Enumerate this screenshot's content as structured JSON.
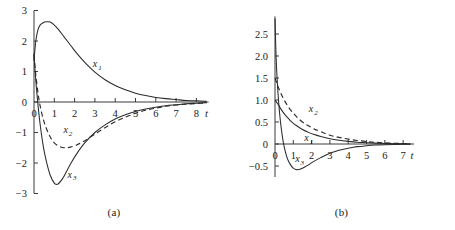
{
  "figure": {
    "kind": "two-panel-line-plot",
    "background": "#ffffff",
    "ink_color": "#2b2b2b"
  },
  "panels": [
    {
      "id": "a",
      "caption": "(a)",
      "xlabel": "t",
      "ylabel": "",
      "xticks": [
        "0",
        "1",
        "2",
        "3",
        "4",
        "5",
        "6",
        "7",
        "8"
      ],
      "yticks": [
        "3",
        "2",
        "1",
        "0",
        "-1",
        "-2",
        "-3"
      ],
      "curve_labels": [
        {
          "base": "x",
          "sub": "1"
        },
        {
          "base": "x",
          "sub": "2"
        },
        {
          "base": "x",
          "sub": "3"
        }
      ]
    },
    {
      "id": "b",
      "caption": "(b)",
      "xlabel": "t",
      "ylabel": "",
      "xticks": [
        "0",
        "1",
        "2",
        "3",
        "4",
        "5",
        "6",
        "7"
      ],
      "yticks": [
        "2.5",
        "2.0",
        "1.5",
        "1.0",
        "0.5",
        "0",
        "-0.5"
      ],
      "curve_labels": [
        {
          "base": "x",
          "sub": "1"
        },
        {
          "base": "x",
          "sub": "2"
        },
        {
          "base": "x",
          "sub": "3"
        }
      ]
    }
  ],
  "chart_data": [
    {
      "type": "line",
      "panel": "(a)",
      "title": "",
      "xlabel": "t",
      "ylabel": "",
      "xlim": [
        0,
        8.6
      ],
      "ylim": [
        -3,
        3
      ],
      "xticks": [
        0,
        1,
        2,
        3,
        4,
        5,
        6,
        7,
        8
      ],
      "yticks": [
        -3,
        -2,
        -1,
        0,
        1,
        2,
        3
      ],
      "grid": false,
      "legend": "inline-labels",
      "series": [
        {
          "name": "x1",
          "style": "solid",
          "label_pos": [
            2.9,
            1.15
          ],
          "x": [
            0,
            0.05,
            0.1,
            0.2,
            0.3,
            0.45,
            0.6,
            0.8,
            1.0,
            1.2,
            1.5,
            1.8,
            2.1,
            2.5,
            3.0,
            3.5,
            4.0,
            4.5,
            5.0,
            5.5,
            6.0,
            6.5,
            7.0,
            7.5,
            8.0,
            8.5
          ],
          "y": [
            1.35,
            1.75,
            2.05,
            2.38,
            2.52,
            2.6,
            2.63,
            2.62,
            2.52,
            2.38,
            2.12,
            1.86,
            1.6,
            1.3,
            0.98,
            0.73,
            0.54,
            0.4,
            0.29,
            0.21,
            0.15,
            0.11,
            0.08,
            0.05,
            0.04,
            0.02
          ]
        },
        {
          "name": "x2",
          "style": "dashed",
          "label_pos": [
            1.45,
            -1.02
          ],
          "x": [
            0,
            0.05,
            0.1,
            0.2,
            0.3,
            0.45,
            0.6,
            0.8,
            1.0,
            1.2,
            1.4,
            1.6,
            1.8,
            2.1,
            2.5,
            3.0,
            3.5,
            4.0,
            4.5,
            5.0,
            5.5,
            6.0,
            6.5,
            7.0,
            7.5,
            8.0,
            8.5
          ],
          "y": [
            1.55,
            1.15,
            0.82,
            0.28,
            -0.12,
            -0.55,
            -0.85,
            -1.15,
            -1.34,
            -1.44,
            -1.49,
            -1.5,
            -1.48,
            -1.41,
            -1.27,
            -1.05,
            -0.84,
            -0.65,
            -0.5,
            -0.37,
            -0.27,
            -0.2,
            -0.14,
            -0.1,
            -0.07,
            -0.05,
            -0.03
          ]
        },
        {
          "name": "x3",
          "style": "solid",
          "label_pos": [
            1.65,
            -2.48
          ],
          "x": [
            0,
            0.05,
            0.1,
            0.2,
            0.3,
            0.45,
            0.6,
            0.8,
            1.0,
            1.1,
            1.2,
            1.4,
            1.6,
            1.8,
            2.1,
            2.5,
            3.0,
            3.5,
            4.0,
            4.5,
            5.0,
            5.5,
            6.0,
            6.5,
            7.0,
            7.5,
            8.0,
            8.5
          ],
          "y": [
            1.6,
            1.05,
            0.62,
            -0.12,
            -0.72,
            -1.42,
            -1.92,
            -2.4,
            -2.66,
            -2.7,
            -2.68,
            -2.52,
            -2.28,
            -2.03,
            -1.7,
            -1.34,
            -1.0,
            -0.75,
            -0.56,
            -0.42,
            -0.31,
            -0.23,
            -0.17,
            -0.12,
            -0.09,
            -0.06,
            -0.04,
            -0.02
          ]
        }
      ]
    },
    {
      "type": "line",
      "panel": "(b)",
      "title": "",
      "xlabel": "t",
      "ylabel": "",
      "xlim": [
        0,
        7.6
      ],
      "ylim": [
        -0.75,
        2.9
      ],
      "xticks": [
        0,
        1,
        2,
        3,
        4,
        5,
        6,
        7
      ],
      "yticks": [
        -0.5,
        0,
        0.5,
        1.0,
        1.5,
        2.0,
        2.5
      ],
      "grid": false,
      "legend": "inline-labels",
      "series": [
        {
          "name": "x1",
          "style": "solid",
          "label_pos": [
            1.6,
            0.06
          ],
          "x": [
            0,
            0.1,
            0.2,
            0.3,
            0.45,
            0.6,
            0.8,
            1.0,
            1.2,
            1.5,
            1.8,
            2.1,
            2.5,
            3.0,
            3.5,
            4.0,
            4.5,
            5.0,
            5.5,
            6.0,
            6.5,
            7.0,
            7.4
          ],
          "y": [
            1.0,
            0.94,
            0.88,
            0.81,
            0.72,
            0.64,
            0.55,
            0.47,
            0.41,
            0.33,
            0.27,
            0.22,
            0.17,
            0.12,
            0.085,
            0.06,
            0.04,
            0.03,
            0.02,
            0.012,
            0.008,
            0.004,
            0.002
          ]
        },
        {
          "name": "x2",
          "style": "dashed",
          "label_pos": [
            1.85,
            0.72
          ],
          "x": [
            0,
            0.1,
            0.2,
            0.3,
            0.45,
            0.6,
            0.8,
            1.0,
            1.2,
            1.5,
            1.8,
            2.1,
            2.5,
            3.0,
            3.5,
            4.0,
            4.5,
            5.0,
            5.5,
            6.0,
            6.5,
            7.0,
            7.4
          ],
          "y": [
            1.5,
            1.38,
            1.27,
            1.17,
            1.04,
            0.93,
            0.8,
            0.7,
            0.61,
            0.5,
            0.42,
            0.35,
            0.28,
            0.2,
            0.15,
            0.11,
            0.08,
            0.055,
            0.038,
            0.025,
            0.016,
            0.01,
            0.005
          ]
        },
        {
          "name": "x3",
          "style": "solid",
          "label_pos": [
            1.1,
            -0.42
          ],
          "x": [
            0,
            0.05,
            0.1,
            0.2,
            0.3,
            0.4,
            0.5,
            0.65,
            0.8,
            1.0,
            1.15,
            1.3,
            1.5,
            1.8,
            2.1,
            2.5,
            3.0,
            3.5,
            4.0,
            4.5,
            5.0,
            5.5,
            6.0,
            6.5,
            7.0,
            7.4
          ],
          "y": [
            2.85,
            2.1,
            1.6,
            0.95,
            0.5,
            0.18,
            -0.06,
            -0.3,
            -0.44,
            -0.55,
            -0.58,
            -0.58,
            -0.55,
            -0.48,
            -0.4,
            -0.31,
            -0.21,
            -0.14,
            -0.095,
            -0.06,
            -0.04,
            -0.025,
            -0.016,
            -0.01,
            -0.006,
            -0.003
          ]
        }
      ]
    }
  ]
}
